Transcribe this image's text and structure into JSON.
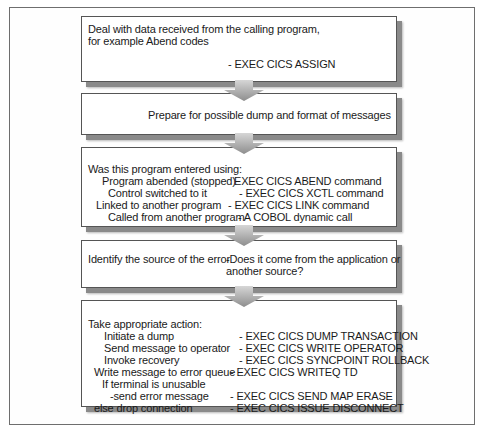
{
  "diagram": {
    "steps": [
      {
        "id": "deal-with-data",
        "lines": [
          "Deal with data received from the calling program,",
          "for example Abend codes"
        ],
        "command": "- EXEC CICS ASSIGN"
      },
      {
        "id": "prepare-dump",
        "text": "Prepare for possible dump and format of messages"
      },
      {
        "id": "entry-method",
        "heading": "Was this program entered using:",
        "rows": [
          {
            "condition": "Program abended (stopped)",
            "command": "EXEC CICS ABEND command"
          },
          {
            "condition": "Control switched to it",
            "command": "- EXEC CICS XCTL command"
          },
          {
            "condition": "Linked to another program",
            "command": "- EXEC CICS LINK command"
          },
          {
            "condition": "Called from another program",
            "command": "- A COBOL dynamic call"
          }
        ]
      },
      {
        "id": "identify-source",
        "label": "Identify the source of the error",
        "question_lines": [
          "-Does it come from the application or",
          "another source?"
        ]
      },
      {
        "id": "take-action",
        "heading": "Take appropriate action:",
        "rows": [
          {
            "action": "Initiate a dump",
            "command": "- EXEC CICS DUMP TRANSACTION"
          },
          {
            "action": "Send message to operator",
            "command": "- EXEC CICS WRITE OPERATOR"
          },
          {
            "action": "Invoke recovery",
            "command": "- EXEC CICS SYNCPOINT ROLLBACK"
          },
          {
            "action": "Write message to error queue",
            "command": "- EXEC CICS WRITEQ TD"
          },
          {
            "action": "If terminal is unusable",
            "command": ""
          },
          {
            "action": "-send error message",
            "command": "- EXEC CICS SEND MAP ERASE"
          },
          {
            "action": "else drop connection",
            "command": "- EXEC CICS ISSUE DISCONNECT"
          }
        ]
      }
    ],
    "arrow_icon": "down-arrow-icon"
  }
}
